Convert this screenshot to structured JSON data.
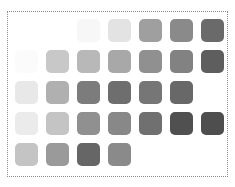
{
  "grid": {
    "origin_x": 15,
    "origin_y": 19,
    "pitch_x": 31,
    "pitch_y": 31,
    "rows": [
      [
        null,
        null,
        "#f7f7f7",
        "#e3e3e3",
        "#9f9f9f",
        "#8a8a8a",
        "#6a6a6a"
      ],
      [
        "#fbfbfb",
        "#c8c8c8",
        "#b8b8b8",
        "#a8a8a8",
        "#909090",
        "#828282",
        "#5e5e5e"
      ],
      [
        "#e8e8e8",
        "#b0b0b0",
        "#7c7c7c",
        "#6e6e6e",
        "#767676",
        "#686868",
        null
      ],
      [
        "#ebebeb",
        "#c4c4c4",
        "#909090",
        "#888888",
        "#707070",
        "#505050",
        "#4e4e4e"
      ],
      [
        "#c4c4c4",
        "#9a9a9a",
        "#666666",
        "#8a8a8a",
        null,
        null,
        null
      ]
    ]
  }
}
